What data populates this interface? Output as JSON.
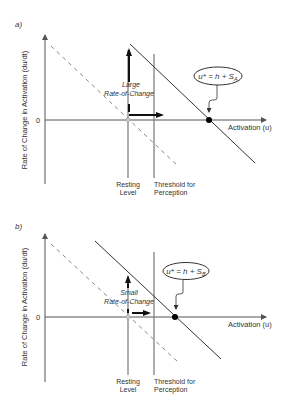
{
  "panels": [
    {
      "id": "a",
      "panel_label": "a)",
      "y_axis_label": "Rate of Change in Activation (du/dt)",
      "zero_label": "0",
      "x_axis_label": "Activation (u)",
      "resting_label_line1": "Resting",
      "resting_label_line2": "Level",
      "threshold_label_line1": "Threshold for",
      "threshold_label_line2": "Perception",
      "rate_label_line1": "Large",
      "rate_label_line2": "Rate-of-Change",
      "fixed_point_equation": "u* = h + S",
      "fixed_point_subscript": "A",
      "rate_magnitude": "large"
    },
    {
      "id": "b",
      "panel_label": "b)",
      "y_axis_label": "Rate of Change in Activation (du/dt)",
      "zero_label": "0",
      "x_axis_label": "Activation (u)",
      "resting_label_line1": "Resting",
      "resting_label_line2": "Level",
      "threshold_label_line1": "Threshold for",
      "threshold_label_line2": "Perception",
      "rate_label_line1": "Small",
      "rate_label_line2": "Rate-of-Change",
      "fixed_point_equation": "u* = h + S",
      "fixed_point_subscript": "B",
      "rate_magnitude": "small"
    }
  ],
  "colors": {
    "axis": "#555555",
    "line": "#333333",
    "dashed": "#888888",
    "vertical": "#777777",
    "arrow": "#111111",
    "point": "#000000"
  }
}
